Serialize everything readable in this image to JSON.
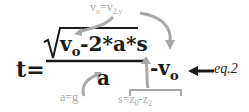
{
  "equation": {
    "lhs": "t=",
    "numerator": {
      "v": "v",
      "v_sub": "o",
      "rest": "-2*a*s"
    },
    "denominator": "a",
    "tail_v": "-v",
    "tail_v_sub": "o",
    "label": "eq.2"
  },
  "annotations": {
    "top": {
      "v": "v",
      "v_sub": "o",
      "eq": "=v",
      "v2_sub": "2,y"
    },
    "bottom_left": "a=g",
    "bottom_right": {
      "s": "s=",
      "z0": "z",
      "z0_sub": "0",
      "minus": "-z",
      "z2_sub": "2"
    }
  },
  "colors": {
    "main_text": "#1a1a1a",
    "annotation": "#a8a8a8",
    "arrow": "#a8a8a8"
  }
}
